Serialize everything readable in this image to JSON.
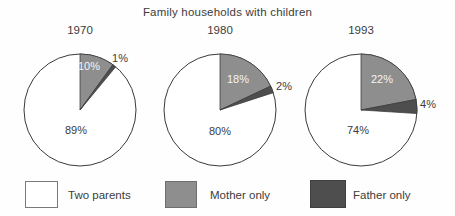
{
  "title": "Family households with children",
  "colors": {
    "two_parents": "#ffffff",
    "mother_only": "#8e8e8e",
    "father_only": "#4e4e4e",
    "outline": "#3a3a3a"
  },
  "legend": {
    "items": [
      {
        "key": "two_parents",
        "label": "Two parents"
      },
      {
        "key": "mother_only",
        "label": "Mother only"
      },
      {
        "key": "father_only",
        "label": "Father only"
      }
    ]
  },
  "chart_data": [
    {
      "type": "pie",
      "year": "1970",
      "categories": [
        "Two parents",
        "Mother only",
        "Father only"
      ],
      "values": [
        89,
        10,
        1
      ],
      "value_labels": [
        "89%",
        "10%",
        "1%"
      ],
      "start_angle_deg": 0,
      "direction": "clockwise"
    },
    {
      "type": "pie",
      "year": "1980",
      "categories": [
        "Two parents",
        "Mother only",
        "Father only"
      ],
      "values": [
        80,
        18,
        2
      ],
      "value_labels": [
        "80%",
        "18%",
        "2%"
      ],
      "start_angle_deg": 0,
      "direction": "clockwise"
    },
    {
      "type": "pie",
      "year": "1993",
      "categories": [
        "Two parents",
        "Mother only",
        "Father only"
      ],
      "values": [
        74,
        22,
        4
      ],
      "value_labels": [
        "74%",
        "22%",
        "4%"
      ],
      "start_angle_deg": 0,
      "direction": "clockwise"
    }
  ]
}
